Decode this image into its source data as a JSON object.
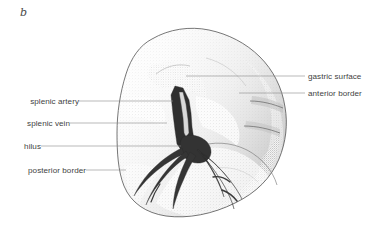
{
  "figure": {
    "panel_letter": "b",
    "style": "stippled ink drawing",
    "background_color": "#ffffff",
    "ink_color": "#3a3a3a",
    "leader_color": "#8c8c8c",
    "text_color": "#3f3f3f"
  },
  "labels": {
    "left": [
      {
        "id": "splenic-artery",
        "text": "splenic artery",
        "text_x": 16,
        "text_y": 97,
        "leader_from_x": 79,
        "leader_y": 101,
        "leader_to_x": 173
      },
      {
        "id": "splenic-vein",
        "text": "splenic vein",
        "text_x": 16,
        "text_y": 119,
        "leader_from_x": 70,
        "leader_y": 123,
        "leader_to_x": 167
      },
      {
        "id": "hilus",
        "text": "hilus",
        "text_x": 16,
        "text_y": 142,
        "leader_from_x": 41,
        "leader_y": 146,
        "leader_to_x": 181
      },
      {
        "id": "posterior-border",
        "text": "posterior border",
        "text_x": 16,
        "text_y": 166,
        "leader_from_x": 86,
        "leader_y": 170,
        "leader_to_x": 126
      }
    ],
    "right": [
      {
        "id": "gastric-surface",
        "text": "gastric surface",
        "text_x": 308,
        "text_y": 72,
        "leader_from_x": 305,
        "leader_y": 76,
        "leader_to_x": 186
      },
      {
        "id": "anterior-border",
        "text": "anterior border",
        "text_x": 308,
        "text_y": 89,
        "leader_from_x": 305,
        "leader_y": 93,
        "leader_to_x": 239
      }
    ]
  },
  "diagram_geometry": {
    "organ_outline": "M 152 39 C 140 45 131 58 126 74 C 120 93 117 113 117 133 C 117 152 118 171 124 186 C 131 203 146 213 166 216 C 188 219 213 214 235 203 C 256 193 271 178 279 159 C 286 142 288 124 285 107 C 282 87 273 70 260 57 C 246 43 228 34 209 30 C 190 26 169 29 152 39 Z",
    "anterior_notch_1": "M 262 100 C 270 101 277 103 282 106",
    "anterior_notch_2": "M 255 124 C 266 125 275 127 282 130",
    "inner_contour": "M 196 146 C 212 140 230 141 246 149 C 262 157 273 170 277 184",
    "hilum_ridge": "M 160 79 C 168 72 178 69 188 71",
    "vessel_trunk": "M 172 94 L 176 87 L 183 89 L 188 99 L 190 112 L 191 126 L 193 140 L 190 148 L 183 150 L 178 144 L 176 130 L 174 114 Z",
    "artery_core": "M 180 95 L 184 104 L 186 118 L 187 131",
    "vessel_branches": [
      "M 183 147 C 172 153 160 162 150 173 C 143 181 138 189 135 196 C 138 190 145 181 154 173 C 164 164 175 157 185 153 Z",
      "M 186 149 C 176 158 166 169 158 181 C 152 190 148 198 146 204 C 149 197 155 187 163 178 C 172 167 181 159 189 155 Z",
      "M 190 150 C 184 161 179 173 176 185 C 174 194 173 201 173 207 C 175 200 178 190 183 179 C 188 167 193 158 196 154 Z",
      "M 196 149 C 203 156 209 165 214 175 C 218 183 221 190 223 196 C 221 188 217 178 211 168 C 205 158 200 151 197 148 Z",
      "M 200 152 C 209 158 218 166 226 176 C 233 184 238 192 241 198 C 237 190 231 181 223 172 C 214 162 206 155 201 152 Z",
      "M 204 158 C 212 167 219 177 225 188 C 229 196 232 203 233 208 C 231 200 227 191 221 181 C 214 170 208 162 204 157 Z"
    ],
    "vessel_hub": "M 184 138 C 192 135 201 137 207 143 C 212 149 212 156 207 160 C 201 164 192 163 186 157 C 181 151 180 142 184 138 Z"
  }
}
